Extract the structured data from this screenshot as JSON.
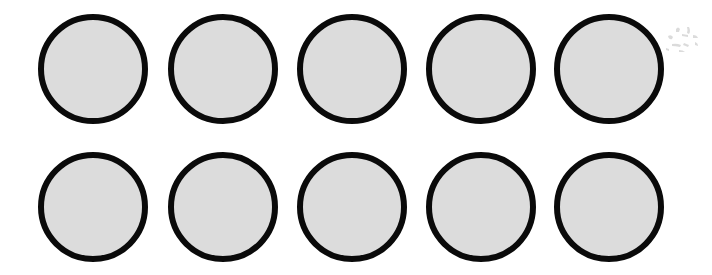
{
  "image": {
    "title": "Grid of ten shaded circles",
    "width": 712,
    "height": 275,
    "background_color": "#ffffff"
  },
  "style": {
    "circle_fill": "#dcdcdc",
    "circle_stroke": "#0a0a0a",
    "stroke_width": 6,
    "diameter": 110
  },
  "grid": {
    "rows": 2,
    "columns": 5,
    "total_shapes": 10,
    "row_centers_y": [
      69,
      207
    ],
    "column_centers_x": [
      93,
      223,
      352,
      481,
      609
    ]
  },
  "shapes": [
    {
      "id": "circle-r1-c1",
      "row": 1,
      "col": 1,
      "cx": 93,
      "cy": 69,
      "d": 110
    },
    {
      "id": "circle-r1-c2",
      "row": 1,
      "col": 2,
      "cx": 223,
      "cy": 69,
      "d": 110
    },
    {
      "id": "circle-r1-c3",
      "row": 1,
      "col": 3,
      "cx": 352,
      "cy": 69,
      "d": 110
    },
    {
      "id": "circle-r1-c4",
      "row": 1,
      "col": 4,
      "cx": 481,
      "cy": 69,
      "d": 110
    },
    {
      "id": "circle-r1-c5",
      "row": 1,
      "col": 5,
      "cx": 609,
      "cy": 69,
      "d": 110
    },
    {
      "id": "circle-r2-c1",
      "row": 2,
      "col": 1,
      "cx": 93,
      "cy": 207,
      "d": 110
    },
    {
      "id": "circle-r2-c2",
      "row": 2,
      "col": 2,
      "cx": 223,
      "cy": 207,
      "d": 110
    },
    {
      "id": "circle-r2-c3",
      "row": 2,
      "col": 3,
      "cx": 352,
      "cy": 207,
      "d": 110
    },
    {
      "id": "circle-r2-c4",
      "row": 2,
      "col": 4,
      "cx": 481,
      "cy": 207,
      "d": 110
    },
    {
      "id": "circle-r2-c5",
      "row": 2,
      "col": 5,
      "cx": 609,
      "cy": 207,
      "d": 110
    }
  ],
  "artifact": {
    "description": "faint scanner smudge",
    "x": 662,
    "y": 22,
    "width": 42,
    "height": 34
  }
}
